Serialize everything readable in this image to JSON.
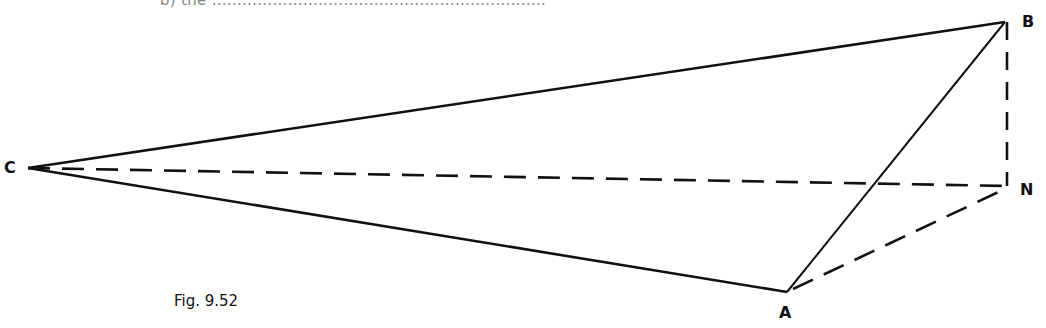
{
  "figure": {
    "caption": "Fig. 9.52",
    "clipped_top_text": "b) the ..................................................................",
    "line_color": "#111111",
    "vertices": {
      "C": {
        "label": "C",
        "x": 28,
        "y": 168
      },
      "B": {
        "label": "B",
        "x": 1005,
        "y": 22
      },
      "N": {
        "label": "N",
        "x": 1007,
        "y": 186
      },
      "A": {
        "label": "A",
        "x": 787,
        "y": 292
      }
    },
    "solid_edges": [
      "CB",
      "CA",
      "AB"
    ],
    "dashed_edges": [
      "CN",
      "BN",
      "AN"
    ]
  }
}
